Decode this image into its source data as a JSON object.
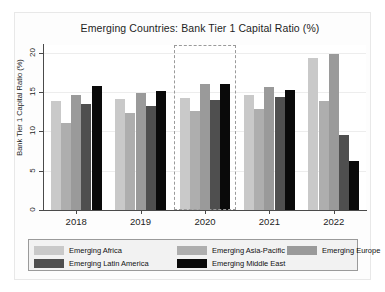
{
  "chart_data": {
    "type": "bar",
    "title": "Emerging Countries: Bank Tier 1 Capital Ratio (%)",
    "xlabel": "",
    "ylabel": "Bank Tier 1 Capital Ratio (%)",
    "categories": [
      "2018",
      "2019",
      "2020",
      "2021",
      "2022"
    ],
    "ylim": [
      0,
      21
    ],
    "yticks": [
      0,
      5,
      10,
      15,
      20
    ],
    "ytick_labels": [
      "0",
      "5",
      "10",
      "15",
      "20"
    ],
    "grid": true,
    "legend_position": "bottom",
    "series": [
      {
        "name": "Emerging Africa",
        "color": "#c9c9c9",
        "values": [
          13.9,
          14.1,
          14.2,
          14.7,
          19.3
        ]
      },
      {
        "name": "Emerging Asia-Pacific",
        "color": "#aeaeae",
        "values": [
          11.1,
          12.4,
          12.6,
          12.9,
          13.9
        ]
      },
      {
        "name": "Emerging Europe",
        "color": "#9a9a9a",
        "values": [
          14.6,
          14.9,
          16.0,
          15.7,
          19.8
        ]
      },
      {
        "name": "Emerging Latin America",
        "color": "#4f4f4f",
        "values": [
          13.5,
          13.2,
          14.0,
          14.4,
          9.5
        ]
      },
      {
        "name": "Emerging Middle East",
        "color": "#0a0a0a",
        "values": [
          15.8,
          15.2,
          16.1,
          15.3,
          6.2
        ]
      }
    ],
    "annotations": [
      {
        "name": "highlight-box",
        "type": "dashed-rectangle",
        "covers_category": "2020",
        "color": "#9a9a9a"
      }
    ]
  }
}
